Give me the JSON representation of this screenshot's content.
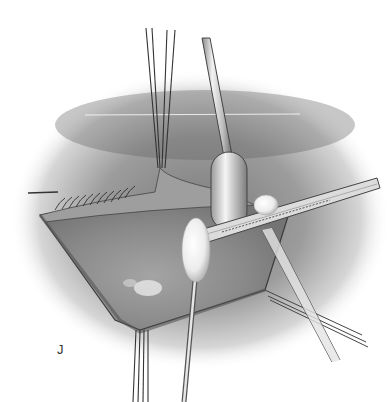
{
  "figure": {
    "panel_label": "J",
    "elements": [
      "periorbital-skin-shading",
      "upper-eyelid-with-lashes",
      "exposed-orbital-field",
      "traction-sutures",
      "suction-tip",
      "forceps",
      "cotton-tipped-applicators",
      "retractor-rods"
    ],
    "colors": {
      "background": "#ffffff",
      "shading_dark": "#6a6a6a",
      "shading_mid": "#9a9a9a",
      "shading_light": "#d8d8d8",
      "line": "#2e2e2e"
    }
  }
}
